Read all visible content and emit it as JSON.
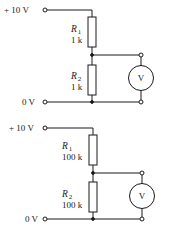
{
  "circuits": [
    {
      "supply_label": "+ 10 V",
      "ground_label": "0 V",
      "r1": {
        "name": "R",
        "sub": "1",
        "value": "1 k"
      },
      "r2": {
        "name": "R",
        "sub": "2",
        "value": "1 k"
      },
      "meter_label": "V"
    },
    {
      "supply_label": "+ 10 V",
      "ground_label": "0 V",
      "r1": {
        "name": "R",
        "sub": "1",
        "value": "100 k"
      },
      "r2": {
        "name": "R",
        "sub": "2",
        "value": "100 k"
      },
      "meter_label": "V"
    }
  ]
}
